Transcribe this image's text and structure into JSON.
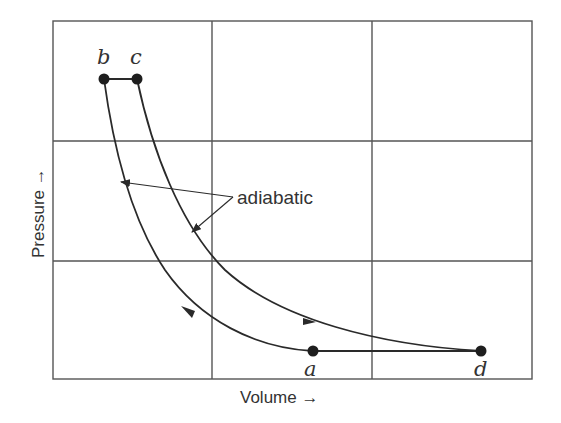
{
  "diagram": {
    "title": "",
    "type": "pressure-volume cycle diagram",
    "x_axis_label": "Volume →",
    "y_axis_label": "Pressure →",
    "annotation": "adiabatic",
    "points": [
      {
        "id": "a",
        "label": "a"
      },
      {
        "id": "b",
        "label": "b"
      },
      {
        "id": "c",
        "label": "c"
      },
      {
        "id": "d",
        "label": "d"
      }
    ],
    "segments": [
      {
        "from": "a",
        "to": "b",
        "kind": "adiabatic compression curve"
      },
      {
        "from": "b",
        "to": "c",
        "kind": "constant pressure line"
      },
      {
        "from": "c",
        "to": "d",
        "kind": "adiabatic expansion curve"
      },
      {
        "from": "d",
        "to": "a",
        "kind": "constant pressure line"
      }
    ],
    "grid": {
      "columns": 3,
      "rows": 3
    },
    "colors": {
      "line": "#2a2a2a",
      "grid": "#555555",
      "background": "#ffffff"
    }
  }
}
